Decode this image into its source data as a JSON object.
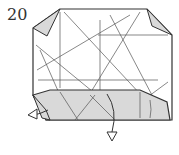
{
  "diagram": {
    "step_number": "20",
    "type": "origami-step",
    "colors": {
      "paper": "#ffffff",
      "shaded": "#d9d9d9",
      "outline": "#333333",
      "crease": "#555555"
    },
    "arrows": [
      {
        "name": "fold-left-arrow",
        "direction": "left"
      },
      {
        "name": "fold-down-arrow",
        "direction": "down"
      }
    ]
  }
}
